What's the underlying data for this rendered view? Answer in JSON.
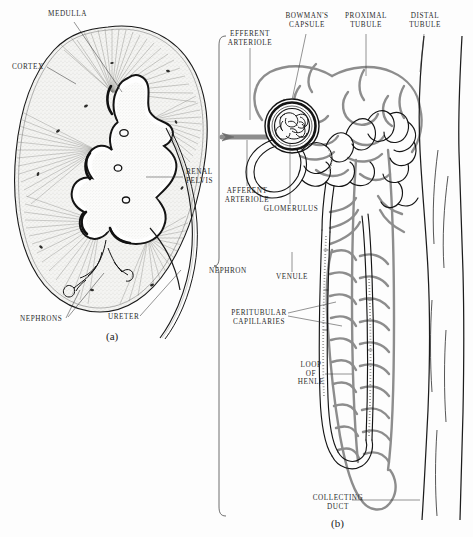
{
  "figure": {
    "background_color": "#fdfdfd",
    "ink_color": "#1a1a1a",
    "vessel_color": "#8a8a8a",
    "label_color": "#2b2b2b"
  },
  "panel_a": {
    "id": "(a)",
    "caption": "Kidney cross-section",
    "labels": [
      {
        "name": "medulla",
        "text": "MEDULLA"
      },
      {
        "name": "cortex",
        "text": "CORTEX"
      },
      {
        "name": "renal-pelvis",
        "text": "RENAL\nPELVIS"
      },
      {
        "name": "nephrons",
        "text": "NEPHRONS"
      },
      {
        "name": "ureter",
        "text": "URETER"
      }
    ]
  },
  "panel_b": {
    "id": "(b)",
    "caption": "Nephron detail",
    "bracket_label": "NEPHRON",
    "labels": [
      {
        "name": "bowmans-capsule",
        "text": "BOWMAN'S\nCAPSULE"
      },
      {
        "name": "proximal-tubule",
        "text": "PROXIMAL\nTUBULE"
      },
      {
        "name": "distal-tubule",
        "text": "DISTAL\nTUBULE"
      },
      {
        "name": "efferent-arteriole",
        "text": "EFFERENT\nARTERIOLE"
      },
      {
        "name": "afferent-arteriole",
        "text": "AFFERENT\nARTERIOLE"
      },
      {
        "name": "glomerulus",
        "text": "GLOMERULUS"
      },
      {
        "name": "venule",
        "text": "VENULE"
      },
      {
        "name": "peritubular-capillaries",
        "text": "PERITUBULAR\nCAPILLARIES"
      },
      {
        "name": "loop-of-henle",
        "text": "LOOP\nOF\nHENLE"
      },
      {
        "name": "collecting-duct",
        "text": "COLLECTING\nDUCT"
      },
      {
        "name": "nephron",
        "text": "NEPHRON"
      }
    ]
  }
}
